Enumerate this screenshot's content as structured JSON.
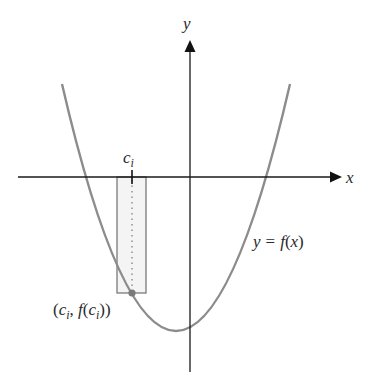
{
  "diagram": {
    "type": "riemann-sum-single-rectangle",
    "colors": {
      "axis": "#1a1a1a",
      "curve": "#8c8c8c",
      "rectangle_stroke": "#7a7a7a",
      "rectangle_fill": "#f4f4f4",
      "dotted_line": "#777777",
      "point": "#7a7a7a",
      "text": "#2a2a2a"
    },
    "axes": {
      "x_label": "x",
      "y_label": "y"
    },
    "curve": {
      "label_y": "y",
      "label_eq": "=",
      "label_f": "f",
      "label_open": "(",
      "label_x": "x",
      "label_close": ")"
    },
    "sample_point": {
      "tick_label_c": "c",
      "tick_label_sub": "i",
      "point_label_open": "(",
      "point_label_c": "c",
      "point_label_sub1": "i",
      "point_label_comma": ", ",
      "point_label_f": "f",
      "point_label_paren": "(",
      "point_label_c2": "c",
      "point_label_sub2": "i",
      "point_label_close": "))"
    }
  }
}
